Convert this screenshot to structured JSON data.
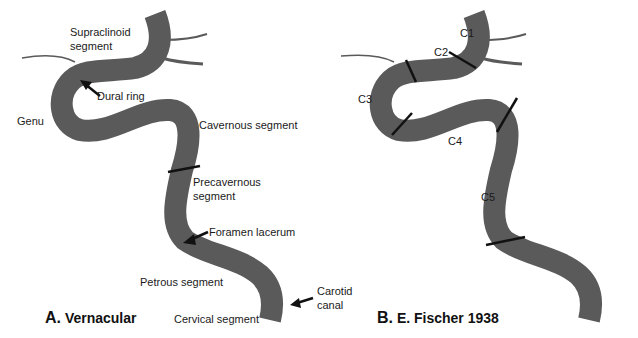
{
  "colors": {
    "vessel": "#5a5a5a",
    "marker": "#111111",
    "text": "#1a1a1a"
  },
  "panel_a": {
    "title_letter": "A.",
    "title_text": "Vernacular",
    "labels": {
      "supraclinoid_1": "Supraclinoid",
      "supraclinoid_2": "segment",
      "dural_ring": "Dural ring",
      "genu": "Genu",
      "cavernous": "Cavernous segment",
      "precavernous_1": "Precavernous",
      "precavernous_2": "segment",
      "foramen_lacerum": "Foramen lacerum",
      "petrous": "Petrous segment",
      "carotid_canal_1": "Carotid",
      "carotid_canal_2": "canal",
      "cervical": "Cervical segment"
    }
  },
  "panel_b": {
    "title_letter": "B.",
    "title_text": "E. Fischer 1938",
    "labels": {
      "c1": "C1",
      "c2": "C2",
      "c3": "C3",
      "c4": "C4",
      "c5": "C5"
    }
  }
}
